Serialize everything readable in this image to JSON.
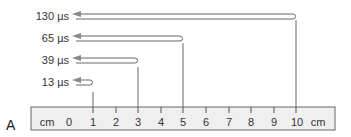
{
  "figure": {
    "panel_letter": "A",
    "ruler": {
      "unit_left": "cm",
      "unit_right": "cm",
      "ticks": [
        "0",
        "1",
        "2",
        "3",
        "4",
        "5",
        "6",
        "7",
        "8",
        "9",
        "10"
      ]
    },
    "echoes": [
      {
        "label": "130 µs",
        "depth_cm": 10
      },
      {
        "label": "65 µs",
        "depth_cm": 5
      },
      {
        "label": "39 µs",
        "depth_cm": 3
      },
      {
        "label": "13 µs",
        "depth_cm": 1
      }
    ],
    "colors": {
      "line": "#555555",
      "arrow_fill": "#888888",
      "ruler_fill": "#efefef",
      "ruler_stroke": "#666666"
    }
  }
}
